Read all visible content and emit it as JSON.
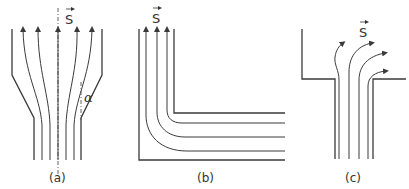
{
  "figure": {
    "panels": [
      {
        "id": "a",
        "caption": "(a)",
        "vector_label": "S",
        "angle_label": "α",
        "description": "converging nozzle with streamlines"
      },
      {
        "id": "b",
        "caption": "(b)",
        "vector_label": "S",
        "description": "90-degree bend with streamlines"
      },
      {
        "id": "c",
        "caption": "(c)",
        "vector_label": "S",
        "description": "sudden expansion with streamlines"
      }
    ],
    "colors": {
      "line": "#3a3a3a",
      "background": "#ffffff"
    }
  }
}
